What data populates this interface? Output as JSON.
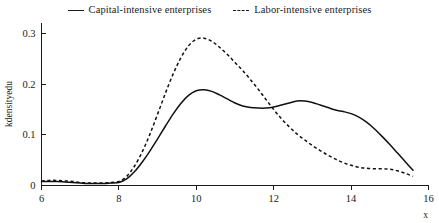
{
  "legend": {
    "position": "top-center",
    "entries": [
      {
        "label": "Capital-intensive enterprises",
        "style": "solid",
        "icon": "line-solid-icon"
      },
      {
        "label": "Labor-intensive enterprises",
        "style": "dashed",
        "icon": "line-dashed-icon"
      }
    ]
  },
  "axes": {
    "y": {
      "title": "kdensityedu",
      "ticks": [
        "0",
        "0.1",
        "0.2",
        "0.3"
      ],
      "tick_values": [
        0,
        0.1,
        0.2,
        0.3
      ],
      "range": [
        0,
        0.32
      ]
    },
    "x": {
      "title": "x",
      "ticks": [
        "6",
        "8",
        "10",
        "12",
        "14",
        "16"
      ],
      "tick_values": [
        6,
        8,
        10,
        12,
        14,
        16
      ],
      "range": [
        6,
        16
      ]
    }
  },
  "chart_data": {
    "type": "line",
    "title": "",
    "subtitle": "",
    "xlabel": "x",
    "ylabel": "kdensityedu",
    "xlim": [
      6,
      16
    ],
    "ylim": [
      0,
      0.32
    ],
    "grid": false,
    "legend_position": "top-center",
    "annotations": [],
    "series": [
      {
        "name": "Capital-intensive enterprises",
        "style": "solid",
        "color": "#111111",
        "x": [
          6.0,
          6.2,
          6.4,
          6.6,
          6.8,
          7.0,
          7.2,
          7.4,
          7.6,
          7.8,
          8.0,
          8.2,
          8.4,
          8.6,
          8.8,
          9.0,
          9.2,
          9.4,
          9.6,
          9.8,
          10.0,
          10.2,
          10.4,
          10.6,
          10.8,
          11.0,
          11.2,
          11.4,
          11.6,
          11.8,
          12.0,
          12.2,
          12.4,
          12.6,
          12.8,
          13.0,
          13.2,
          13.4,
          13.6,
          13.8,
          14.0,
          14.2,
          14.4,
          14.6,
          14.8,
          15.0,
          15.2,
          15.4,
          15.6
        ],
        "y": [
          0.008,
          0.008,
          0.008,
          0.007,
          0.006,
          0.005,
          0.004,
          0.004,
          0.004,
          0.005,
          0.006,
          0.013,
          0.027,
          0.046,
          0.068,
          0.092,
          0.117,
          0.141,
          0.162,
          0.178,
          0.187,
          0.189,
          0.186,
          0.179,
          0.171,
          0.163,
          0.157,
          0.154,
          0.153,
          0.153,
          0.155,
          0.159,
          0.163,
          0.167,
          0.167,
          0.164,
          0.159,
          0.154,
          0.149,
          0.146,
          0.142,
          0.135,
          0.125,
          0.112,
          0.097,
          0.081,
          0.064,
          0.047,
          0.03
        ]
      },
      {
        "name": "Labor-intensive enterprises",
        "style": "dashed",
        "color": "#111111",
        "x": [
          6.0,
          6.2,
          6.4,
          6.6,
          6.8,
          7.0,
          7.2,
          7.4,
          7.6,
          7.8,
          8.0,
          8.2,
          8.4,
          8.6,
          8.8,
          9.0,
          9.2,
          9.4,
          9.6,
          9.8,
          10.0,
          10.2,
          10.4,
          10.6,
          10.8,
          11.0,
          11.2,
          11.4,
          11.6,
          11.8,
          12.0,
          12.2,
          12.4,
          12.6,
          12.8,
          13.0,
          13.2,
          13.4,
          13.6,
          13.8,
          14.0,
          14.2,
          14.4,
          14.6,
          14.8,
          15.0,
          15.2,
          15.4,
          15.6
        ],
        "y": [
          0.009,
          0.01,
          0.01,
          0.009,
          0.008,
          0.006,
          0.005,
          0.005,
          0.005,
          0.006,
          0.008,
          0.018,
          0.038,
          0.066,
          0.101,
          0.141,
          0.182,
          0.22,
          0.252,
          0.276,
          0.289,
          0.291,
          0.285,
          0.273,
          0.259,
          0.243,
          0.227,
          0.209,
          0.19,
          0.17,
          0.15,
          0.132,
          0.116,
          0.102,
          0.09,
          0.079,
          0.069,
          0.06,
          0.052,
          0.045,
          0.04,
          0.036,
          0.034,
          0.033,
          0.033,
          0.032,
          0.029,
          0.024,
          0.018
        ]
      }
    ]
  }
}
